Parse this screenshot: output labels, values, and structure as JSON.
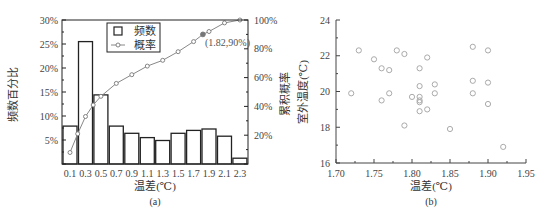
{
  "figure": {
    "panel_a_caption": "(a)",
    "panel_b_caption": "(b)"
  },
  "chart_data": [
    {
      "type": "bar",
      "panel": "(a)",
      "title": "",
      "xlabel": "温差(℃)",
      "ylabel": "频数百分比",
      "ylabel_right": "累积概率",
      "categories": [
        "0.1",
        "0.3",
        "0.5",
        "0.7",
        "0.9",
        "1.1",
        "1.3",
        "1.5",
        "1.7",
        "1.9",
        "2.1",
        "2.3"
      ],
      "ylim": [
        0,
        30
      ],
      "ylim_right": [
        0,
        100
      ],
      "yticks": [
        "5%",
        "10%",
        "15%",
        "20%",
        "25%",
        "30%"
      ],
      "yticks_right": [
        "20%",
        "40%",
        "60%",
        "80%",
        "100%"
      ],
      "grid": false,
      "legend": {
        "position": "upper-left-inside",
        "entries": [
          "频数",
          "概率"
        ]
      },
      "series": [
        {
          "name": "频数",
          "kind": "bar",
          "axis": "left",
          "values": [
            7.9,
            25.5,
            14.4,
            7.9,
            6.4,
            5.5,
            4.9,
            6.4,
            7.0,
            7.3,
            5.8,
            1.2
          ]
        },
        {
          "name": "概率",
          "kind": "line",
          "axis": "right",
          "x": [
            0.1,
            0.3,
            0.5,
            0.7,
            0.9,
            1.1,
            1.3,
            1.5,
            1.7,
            1.82,
            1.9,
            2.1,
            2.3
          ],
          "values": [
            8,
            33,
            47,
            56,
            62,
            68,
            72,
            78,
            85,
            90,
            92,
            98,
            100
          ]
        }
      ],
      "extra_line_points": [
        {
          "x": 0.2,
          "y": 21
        },
        {
          "x": 0.4,
          "y": 41
        }
      ],
      "annotations": [
        {
          "text": "(1.82,90%)",
          "x": 1.82,
          "y": 90,
          "highlight": true
        }
      ]
    },
    {
      "type": "scatter",
      "panel": "(b)",
      "title": "",
      "xlabel": "温差(℃)",
      "ylabel": "室外温度(℃)",
      "xlim": [
        1.7,
        1.95
      ],
      "ylim": [
        16,
        24
      ],
      "xticks": [
        "1.70",
        "1.75",
        "1.80",
        "1.85",
        "1.90",
        "1.95"
      ],
      "yticks": [
        "16",
        "18",
        "20",
        "22",
        "24"
      ],
      "grid": false,
      "marker": "open-circle",
      "marker_color": "#aaaaaa",
      "series": [
        {
          "name": "data",
          "points": [
            [
              1.72,
              19.9
            ],
            [
              1.73,
              22.3
            ],
            [
              1.75,
              21.8
            ],
            [
              1.76,
              21.3
            ],
            [
              1.76,
              19.5
            ],
            [
              1.77,
              21.2
            ],
            [
              1.77,
              19.9
            ],
            [
              1.78,
              22.3
            ],
            [
              1.79,
              22.1
            ],
            [
              1.79,
              18.1
            ],
            [
              1.8,
              19.7
            ],
            [
              1.81,
              21.3
            ],
            [
              1.81,
              20.3
            ],
            [
              1.81,
              19.7
            ],
            [
              1.81,
              19.5
            ],
            [
              1.81,
              19.4
            ],
            [
              1.81,
              18.9
            ],
            [
              1.82,
              21.9
            ],
            [
              1.82,
              19.0
            ],
            [
              1.83,
              20.4
            ],
            [
              1.83,
              19.9
            ],
            [
              1.85,
              17.9
            ],
            [
              1.88,
              22.5
            ],
            [
              1.88,
              20.6
            ],
            [
              1.88,
              19.9
            ],
            [
              1.9,
              22.3
            ],
            [
              1.9,
              20.5
            ],
            [
              1.9,
              19.3
            ],
            [
              1.92,
              16.9
            ]
          ]
        }
      ]
    }
  ]
}
